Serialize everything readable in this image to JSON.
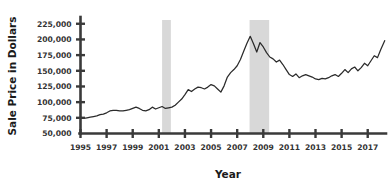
{
  "chart_data": {
    "type": "line",
    "title": "",
    "xlabel": "Year",
    "ylabel": "Sale Price in Dollars",
    "xlim": [
      1995,
      2018.4
    ],
    "ylim": [
      50000,
      231000
    ],
    "grid": false,
    "legend": null,
    "y_ticks": [
      50000,
      75000,
      100000,
      125000,
      150000,
      175000,
      200000,
      225000
    ],
    "y_tick_labels": [
      "50,000",
      "75,000",
      "100,000",
      "125,000",
      "150,000",
      "175,000",
      "200,000",
      "225,000"
    ],
    "x_ticks": [
      1995,
      1997,
      1999,
      2001,
      2003,
      2005,
      2007,
      2009,
      2011,
      2013,
      2015,
      2017
    ],
    "x_tick_labels": [
      "1995",
      "1997",
      "1999",
      "2001",
      "2003",
      "2005",
      "2007",
      "2009",
      "2011",
      "2013",
      "2015",
      "2017"
    ],
    "line_color": "#2b2b2b",
    "band_color": "#d8d8d8",
    "axis_color": "#3a3a3a",
    "annotations": [
      {
        "name": "recession-band-2001",
        "type": "vspan",
        "x_start": 2001.25,
        "x_end": 2001.92
      },
      {
        "name": "recession-band-2008",
        "type": "vspan",
        "x_start": 2007.95,
        "x_end": 2009.45
      }
    ],
    "series": [
      {
        "name": "Median Sale Price",
        "x": [
          1995.0,
          1995.25,
          1995.5,
          1995.75,
          1996.0,
          1996.25,
          1996.5,
          1996.75,
          1997.0,
          1997.25,
          1997.5,
          1997.75,
          1998.0,
          1998.25,
          1998.5,
          1998.75,
          1999.0,
          1999.25,
          1999.5,
          1999.75,
          2000.0,
          2000.25,
          2000.5,
          2000.75,
          2001.0,
          2001.25,
          2001.5,
          2001.75,
          2002.0,
          2002.25,
          2002.5,
          2002.75,
          2003.0,
          2003.25,
          2003.5,
          2003.75,
          2004.0,
          2004.25,
          2004.5,
          2004.75,
          2005.0,
          2005.25,
          2005.5,
          2005.75,
          2006.0,
          2006.25,
          2006.5,
          2006.75,
          2007.0,
          2007.25,
          2007.5,
          2007.75,
          2008.0,
          2008.25,
          2008.5,
          2008.75,
          2009.0,
          2009.25,
          2009.5,
          2009.75,
          2010.0,
          2010.25,
          2010.5,
          2010.75,
          2011.0,
          2011.25,
          2011.5,
          2011.75,
          2012.0,
          2012.25,
          2012.5,
          2012.75,
          2013.0,
          2013.25,
          2013.5,
          2013.75,
          2014.0,
          2014.25,
          2014.5,
          2014.75,
          2015.0,
          2015.25,
          2015.5,
          2015.75,
          2016.0,
          2016.25,
          2016.5,
          2016.75,
          2017.0,
          2017.25,
          2017.5,
          2017.75,
          2018.0,
          2018.3
        ],
        "y": [
          76000,
          74000,
          75000,
          76000,
          77000,
          78000,
          80000,
          81000,
          83000,
          86000,
          87000,
          87000,
          86000,
          86000,
          87000,
          88000,
          90000,
          92000,
          90000,
          87000,
          86000,
          88000,
          92000,
          89000,
          91000,
          93000,
          90000,
          91000,
          92000,
          95000,
          100000,
          105000,
          112000,
          120000,
          117000,
          121000,
          124000,
          123000,
          121000,
          124000,
          128000,
          126000,
          121000,
          116000,
          126000,
          140000,
          147000,
          152000,
          158000,
          168000,
          181000,
          194000,
          205000,
          193000,
          180000,
          195000,
          188000,
          179000,
          172000,
          169000,
          164000,
          167000,
          160000,
          152000,
          144000,
          141000,
          145000,
          139000,
          142000,
          144000,
          142000,
          140000,
          137000,
          136000,
          138000,
          137000,
          139000,
          142000,
          144000,
          141000,
          146000,
          152000,
          147000,
          153000,
          156000,
          150000,
          155000,
          162000,
          158000,
          166000,
          174000,
          171000,
          184000,
          198000
        ]
      }
    ]
  }
}
